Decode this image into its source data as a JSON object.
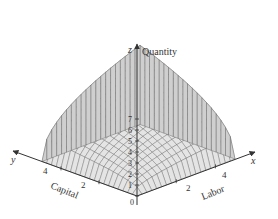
{
  "chart_data": {
    "type": "surface",
    "title": "",
    "function": "Cobb-Douglas production surface z = f(x, y)",
    "xlabel": "Labor",
    "ylabel": "Capital",
    "zlabel": "Quantity",
    "axis_letters": {
      "x": "x",
      "y": "y",
      "z": "z"
    },
    "x_ticks": [
      "2",
      "4"
    ],
    "y_ticks": [
      "4",
      "2"
    ],
    "z_ticks": [
      "0",
      "1",
      "2",
      "3",
      "4",
      "5",
      "6",
      "7"
    ],
    "x_range": [
      0,
      5
    ],
    "y_range": [
      0,
      5
    ],
    "z_range": [
      0,
      8
    ],
    "grid": true,
    "mesh_divisions": 20,
    "colors": {
      "surface": "#e4e4e4",
      "side": "#cfcfcf",
      "mesh": "#555555",
      "axis": "#333333"
    }
  }
}
